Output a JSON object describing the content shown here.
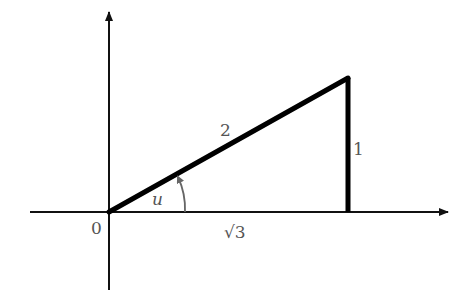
{
  "diagram": {
    "type": "right-triangle-on-axes",
    "colors": {
      "axes": "#111111",
      "triangle": "#000000",
      "labels": "#555555",
      "arc": "#666666"
    },
    "labels": {
      "origin": "0",
      "hypotenuse": "2",
      "opposite": "1",
      "adjacent": "√3",
      "angle": "u"
    }
  }
}
